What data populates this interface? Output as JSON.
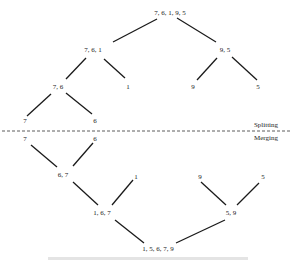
{
  "diagram": {
    "type": "merge-sort-tree",
    "split_nodes": [
      {
        "id": "s0",
        "label": "7, 6, 1, 9, 5",
        "x": 170,
        "y": 13
      },
      {
        "id": "s1",
        "label": "7, 6, 1",
        "x": 93,
        "y": 50
      },
      {
        "id": "s2",
        "label": "9, 5",
        "x": 225,
        "y": 50
      },
      {
        "id": "s3",
        "label": "7, 6",
        "x": 58,
        "y": 87
      },
      {
        "id": "s4",
        "label": "1",
        "x": 128,
        "y": 87
      },
      {
        "id": "s5",
        "label": "9",
        "x": 193,
        "y": 87
      },
      {
        "id": "s6",
        "label": "5",
        "x": 258,
        "y": 87
      },
      {
        "id": "s7",
        "label": "7",
        "x": 25,
        "y": 121
      },
      {
        "id": "s8",
        "label": "6",
        "x": 95,
        "y": 121
      }
    ],
    "merge_nodes": [
      {
        "id": "m0",
        "label": "7",
        "x": 25,
        "y": 139
      },
      {
        "id": "m1",
        "label": "6",
        "x": 95,
        "y": 139
      },
      {
        "id": "m2",
        "label": "6, 7",
        "x": 63,
        "y": 175
      },
      {
        "id": "m3",
        "label": "1",
        "x": 136,
        "y": 177
      },
      {
        "id": "m4",
        "label": "9",
        "x": 200,
        "y": 177
      },
      {
        "id": "m5",
        "label": "5",
        "x": 263,
        "y": 177
      },
      {
        "id": "m6",
        "label": "1, 6, 7",
        "x": 102,
        "y": 213
      },
      {
        "id": "m7",
        "label": "5, 9",
        "x": 231,
        "y": 213
      },
      {
        "id": "m8",
        "label": "1, 5, 6, 7, 9",
        "x": 158,
        "y": 250
      }
    ],
    "phases": {
      "splitting": "Splitting",
      "merging": "Merging"
    }
  }
}
